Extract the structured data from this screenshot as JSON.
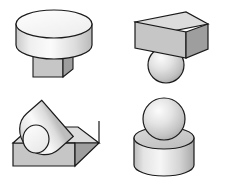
{
  "figure": {
    "background_color": "#ffffff",
    "width": 225,
    "height": 186,
    "outline_color": "#1a1a1a",
    "outline_width": 1.2,
    "palette": {
      "top_face": "#dcdcdc",
      "front_face": "#c6c6c6",
      "side_face": "#9e9e9e",
      "cylinder_light": "#f2f2f2",
      "cylinder_mid": "#cfcfcf",
      "cylinder_dark": "#a8a8a8",
      "sphere_light": "#f4f4f4",
      "sphere_mid": "#d8d8d8",
      "sphere_dark": "#a9a9a9",
      "disc_top": "#f5f5f5"
    }
  },
  "panels": [
    {
      "id": "top-left",
      "name": "disc-on-box",
      "position": "top-left",
      "description": "Wide flat cylinder (disc) resting on top of a narrower cube",
      "shapes": [
        {
          "type": "cylinder",
          "role": "upper",
          "orientation": "vertical",
          "label": "flat wide cylinder"
        },
        {
          "type": "box",
          "role": "lower",
          "orientation": "upright",
          "label": "cube base"
        }
      ],
      "relation": "on-top-of"
    },
    {
      "id": "top-right",
      "name": "box-on-sphere",
      "position": "top-right",
      "description": "Rectangular box balanced on top of a sphere",
      "shapes": [
        {
          "type": "box",
          "role": "upper",
          "orientation": "flat-slab",
          "label": "rectangular slab"
        },
        {
          "type": "sphere",
          "role": "lower",
          "orientation": "n/a",
          "label": "sphere"
        }
      ],
      "relation": "on-top-of"
    },
    {
      "id": "bottom-left",
      "name": "cylinder-on-box-diagonal",
      "position": "bottom-left",
      "description": "Long cylinder lying diagonally across the top face of a box",
      "shapes": [
        {
          "type": "cylinder",
          "role": "upper",
          "orientation": "tilted",
          "label": "tilted long cylinder"
        },
        {
          "type": "box",
          "role": "lower",
          "orientation": "upright",
          "label": "box base"
        }
      ],
      "relation": "lying-on"
    },
    {
      "id": "bottom-right",
      "name": "sphere-on-cylinder",
      "position": "bottom-right",
      "description": "Sphere resting on top of an upright cylinder",
      "shapes": [
        {
          "type": "sphere",
          "role": "upper",
          "orientation": "n/a",
          "label": "sphere"
        },
        {
          "type": "cylinder",
          "role": "lower",
          "orientation": "vertical",
          "label": "upright cylinder"
        }
      ],
      "relation": "on-top-of"
    }
  ]
}
